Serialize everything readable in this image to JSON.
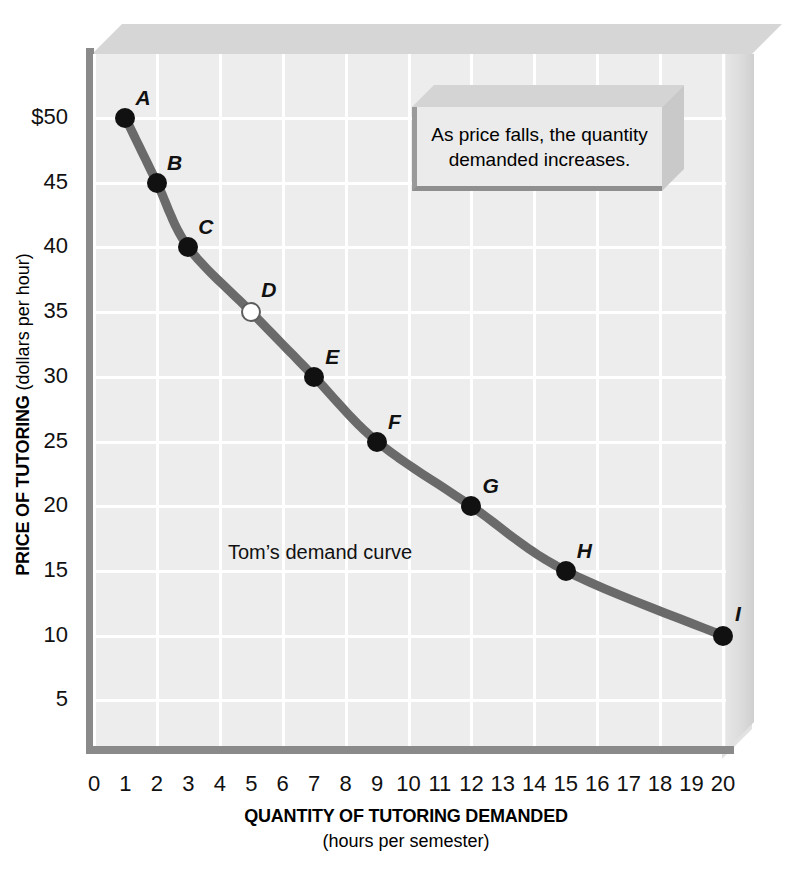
{
  "chart_data": {
    "type": "line",
    "title": "",
    "xlabel": "QUANTITY OF TUTORING DEMANDED",
    "xsublabel": "(hours per semester)",
    "ylabel": "PRICE OF TUTORING",
    "ysublabel": "(dollars per hour)",
    "xlim": [
      0,
      20
    ],
    "ylim": [
      0,
      52
    ],
    "grid": true,
    "legend": "none",
    "series_name": "Tom's demand curve",
    "xticks": [
      "0",
      "1",
      "2",
      "3",
      "4",
      "5",
      "6",
      "7",
      "8",
      "9",
      "10",
      "11",
      "12",
      "13",
      "14",
      "15",
      "16",
      "17",
      "18",
      "19",
      "20"
    ],
    "yticks": [
      "5",
      "10",
      "15",
      "20",
      "25",
      "30",
      "35",
      "40",
      "45",
      "$50"
    ],
    "ytick_values": [
      5,
      10,
      15,
      20,
      25,
      30,
      35,
      40,
      45,
      50
    ],
    "x": [
      1,
      2,
      3,
      5,
      7,
      9,
      12,
      15,
      20
    ],
    "values": [
      50,
      45,
      40,
      35,
      30,
      25,
      20,
      15,
      10
    ],
    "point_labels": [
      "A",
      "B",
      "C",
      "D",
      "E",
      "F",
      "G",
      "H",
      "I"
    ],
    "point_styles": [
      "filled",
      "filled",
      "filled",
      "open",
      "filled",
      "filled",
      "filled",
      "filled",
      "filled"
    ],
    "points": [
      {
        "label": "A",
        "x": 1,
        "y": 50,
        "style": "filled"
      },
      {
        "label": "B",
        "x": 2,
        "y": 45,
        "style": "filled"
      },
      {
        "label": "C",
        "x": 3,
        "y": 40,
        "style": "filled"
      },
      {
        "label": "D",
        "x": 5,
        "y": 35,
        "style": "open"
      },
      {
        "label": "E",
        "x": 7,
        "y": 30,
        "style": "filled"
      },
      {
        "label": "F",
        "x": 9,
        "y": 25,
        "style": "filled"
      },
      {
        "label": "G",
        "x": 12,
        "y": 20,
        "style": "filled"
      },
      {
        "label": "H",
        "x": 15,
        "y": 15,
        "style": "filled"
      },
      {
        "label": "I",
        "x": 20,
        "y": 10,
        "style": "filled"
      }
    ],
    "colors": {
      "curve": "#6a6a6a",
      "point_fill": "#111111",
      "plot_background": "#ededed",
      "gridline": "#ffffff",
      "axis": "#8a8a8a"
    }
  },
  "annotation": {
    "line1": "As price falls, the quantity",
    "line2": "demanded increases."
  },
  "curve_note": "Tom’s demand curve"
}
